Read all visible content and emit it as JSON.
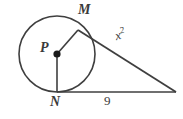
{
  "figure": {
    "kind": "circle-tangent-geometry-diagram",
    "width": 183,
    "height": 119,
    "background_color": "#ffffff",
    "stroke_color": "#3f3f3f",
    "text_color": "#3a3a3a"
  },
  "circle": {
    "center_label": "P",
    "center_x": 57,
    "center_y": 54,
    "radius": 38
  },
  "points": {
    "tangent_point_top": {
      "label": "M",
      "x": 78,
      "y": 30
    },
    "tangent_point_bottom": {
      "label": "N",
      "x": 57,
      "y": 92
    },
    "external_vertex": {
      "label": "",
      "x": 176,
      "y": 92
    }
  },
  "segments": {
    "radius_to_M": {
      "from": "P",
      "to": "M",
      "label": ""
    },
    "radius_to_N": {
      "from": "P",
      "to": "N",
      "label": ""
    },
    "tangent_from_M": {
      "from": "M",
      "to": "external_vertex",
      "label": "x2"
    },
    "tangent_from_N": {
      "from": "N",
      "to": "external_vertex",
      "label": "9"
    }
  },
  "labels": {
    "point_M": "M",
    "point_P": "P",
    "point_N": "N",
    "tangent_upper_base": "x",
    "tangent_upper_exponent": "2",
    "tangent_lower": "9"
  }
}
